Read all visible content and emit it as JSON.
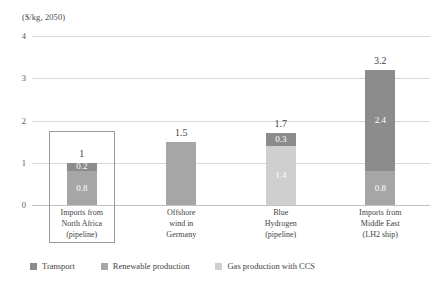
{
  "chart_data": {
    "type": "bar",
    "title": "($/kg, 2050)",
    "subtitle": "",
    "xlabel": "",
    "ylabel": "",
    "ylim": [
      0,
      4
    ],
    "yticks": [
      "0",
      "1",
      "2",
      "3",
      "4"
    ],
    "grid": true,
    "stacked": true,
    "legend_position": "bottom-left",
    "categories": [
      [
        "Imports from",
        "North Africa",
        "(pipeline)"
      ],
      [
        "Offshore",
        "wind in",
        "Germany"
      ],
      [
        "Blue",
        "Hydrogen",
        "(pipeline)"
      ],
      [
        "Imports from",
        "Middle East",
        "(LH2 ship)"
      ]
    ],
    "series": [
      {
        "name": "Transport",
        "color": "#8c8c8c",
        "values": [
          0.2,
          0,
          0.3,
          2.4
        ]
      },
      {
        "name": "Renewable production",
        "color": "#a6a6a6",
        "values": [
          0.8,
          1.5,
          0,
          0.8
        ]
      },
      {
        "name": "Gas production with CCS",
        "color": "#cfcfcf",
        "values": [
          0,
          0,
          1.4,
          0
        ]
      }
    ],
    "totals": [
      "1",
      "1.5",
      "1.7",
      "3.2"
    ],
    "segment_labels": [
      [
        {
          "series": "Transport",
          "text": "0.2"
        },
        {
          "series": "Renewable production",
          "text": "0.8"
        }
      ],
      [],
      [
        {
          "series": "Transport",
          "text": "0.3"
        },
        {
          "series": "Gas production with CCS",
          "text": "1.4"
        }
      ],
      [
        {
          "series": "Transport",
          "text": "2.4"
        },
        {
          "series": "Renewable production",
          "text": "0.8"
        }
      ]
    ],
    "highlight": {
      "category_index": 0,
      "border_color": "#9a9a9a"
    }
  },
  "legend": {
    "items": [
      {
        "label": "Transport",
        "color": "#8c8c8c"
      },
      {
        "label": "Renewable production",
        "color": "#a6a6a6"
      },
      {
        "label": "Gas production with CCS",
        "color": "#cfcfcf"
      }
    ]
  },
  "colors": {
    "transport": "#8c8c8c",
    "renewable_production": "#a6a6a6",
    "gas_production_ccs": "#cfcfcf",
    "gridline": "#d8d8d8",
    "baseline": "#c2c2c2",
    "text": "#3f3f3f",
    "background": "#ffffff"
  }
}
